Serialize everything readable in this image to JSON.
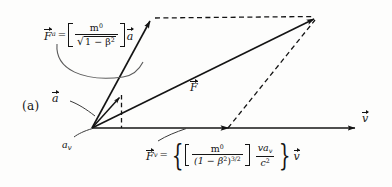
{
  "figure": {
    "panel_label": "(a)",
    "caption_note": "Relativistic force parallelogram: F = F_a + F_v",
    "background_color": "#fdfdfc",
    "ink_color": "#141414"
  },
  "labels": {
    "acceleration_vector": "a",
    "force_vector": "F",
    "velocity_axis": "v",
    "av_component": "a",
    "av_component_sub": "v"
  },
  "formulas": {
    "f_a": {
      "lhs_symbol": "F",
      "lhs_subscript": "a",
      "equals": "=",
      "numerator": "m",
      "numerator_sup": "0",
      "radical_sign": "√",
      "denominator": "1 − β",
      "denominator_sup": "2",
      "multiplier": "a",
      "plain": "F_a = [ m⁰ / √(1 − β²) ] a"
    },
    "f_v": {
      "lhs_symbol": "F",
      "lhs_subscript": "v",
      "equals": "=",
      "brace_open": "{",
      "brace_close": "}",
      "numerator": "m",
      "numerator_sup": "0",
      "denominator": "(1 − β",
      "denominator_sup": "2",
      "denominator_close": ")",
      "denominator_exp": "3/2",
      "second_numerator_v": "v",
      "second_numerator_a": "a",
      "second_numerator_a_sub": "v",
      "second_denominator": "c",
      "second_denominator_sup": "2",
      "multiplier": "v",
      "plain": "F_v = { [ m⁰ / (1 − β²)^{3/2} ] · (v a_v / c²) } v"
    }
  },
  "geometry": {
    "origin": {
      "x": 92,
      "y": 128
    },
    "vertex_top_left": {
      "x": 152,
      "y": 18
    },
    "vertex_top_right": {
      "x": 318,
      "y": 17
    },
    "axis_end": {
      "x": 358,
      "y": 128
    },
    "a_arrow_tip": {
      "x": 121,
      "y": 96
    },
    "fv_arrow_tip": {
      "x": 228,
      "y": 128
    },
    "fa_arrow_tip": {
      "x": 119,
      "y": 94
    }
  }
}
